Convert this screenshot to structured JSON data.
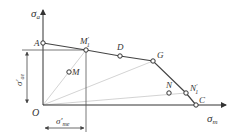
{
  "diagram": {
    "type": "fatigue limit diagram (simplified Haigh / constant-life diagram)",
    "axes": {
      "y_label": "σ",
      "y_label_sub": "a",
      "x_label": "σ",
      "x_label_sub": "m",
      "origin_label": "O"
    },
    "points": {
      "A": "A",
      "M1p": "M",
      "M1p_sup": "′",
      "M1p_sub": "1",
      "D": "D",
      "G": "G",
      "N": "N",
      "N1p": "N",
      "N1p_sup": "′",
      "N1p_sub": "1",
      "C": "C",
      "M": "M"
    },
    "dimensions": {
      "vertical_main": "σ′",
      "vertical_sub": "ae",
      "horizontal_main": "σ′",
      "horizontal_sub": "me"
    },
    "colors": {
      "line": "#444444",
      "guide": "#bbbbbb",
      "text": "#333333"
    }
  }
}
